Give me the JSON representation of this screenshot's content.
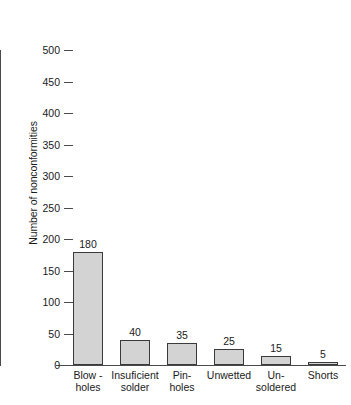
{
  "chart_data": {
    "type": "bar",
    "title": "",
    "xlabel": "",
    "ylabel": "Number of nonconformities",
    "ylim": [
      0,
      500
    ],
    "grid": false,
    "legend": false,
    "y_ticks": [
      0,
      50,
      100,
      150,
      200,
      250,
      300,
      350,
      400,
      450,
      500
    ],
    "y_tick_labels": [
      "0",
      "50",
      "100",
      "150",
      "200",
      "250",
      "300",
      "350",
      "400",
      "450",
      "500"
    ],
    "categories": [
      "Blow - holes",
      "Insuficient solder",
      "Pin- holes",
      "Unwetted",
      "Un- soldered",
      "Shorts"
    ],
    "category_lines": [
      [
        "Blow -",
        "holes"
      ],
      [
        "Insuficient",
        "solder"
      ],
      [
        "Pin-",
        "holes"
      ],
      [
        "Unwetted",
        ""
      ],
      [
        "Un-",
        "soldered"
      ],
      [
        "Shorts",
        ""
      ]
    ],
    "values": [
      180,
      40,
      35,
      25,
      15,
      5
    ],
    "value_labels": [
      "180",
      "40",
      "35",
      "25",
      "15",
      "5"
    ],
    "bar_color": "#d3d3d3",
    "bar_edge_color": "#3a3a3a",
    "axis_color": "#4a4a4a"
  }
}
